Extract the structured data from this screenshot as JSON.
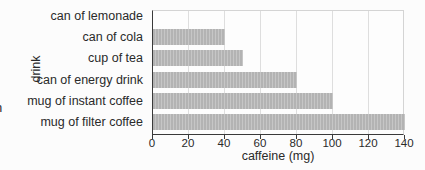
{
  "figure": {
    "background": "#fcfcfc",
    "clipped_left_text": "n"
  },
  "chart_data": {
    "type": "bar",
    "orientation": "horizontal",
    "title": "",
    "xlabel": "caffeine (mg)",
    "ylabel": "drink",
    "categories": [
      "can of lemonade",
      "can of cola",
      "cup of tea",
      "can of energy drink",
      "mug of instant coffee",
      "mug of filter coffee"
    ],
    "values": [
      0,
      40,
      50,
      80,
      100,
      140
    ],
    "xlim": [
      0,
      140
    ],
    "xticks": [
      0,
      20,
      40,
      60,
      80,
      100,
      120,
      140
    ],
    "grid": true,
    "legend": false,
    "colors": {
      "bar": "#b3b3b3",
      "bar_stripe": "#c6c6c6",
      "gridline": "#dedede",
      "frame": "#d4d4d4",
      "axis": "#3a3a3a",
      "text": "#2a2a2a"
    }
  }
}
